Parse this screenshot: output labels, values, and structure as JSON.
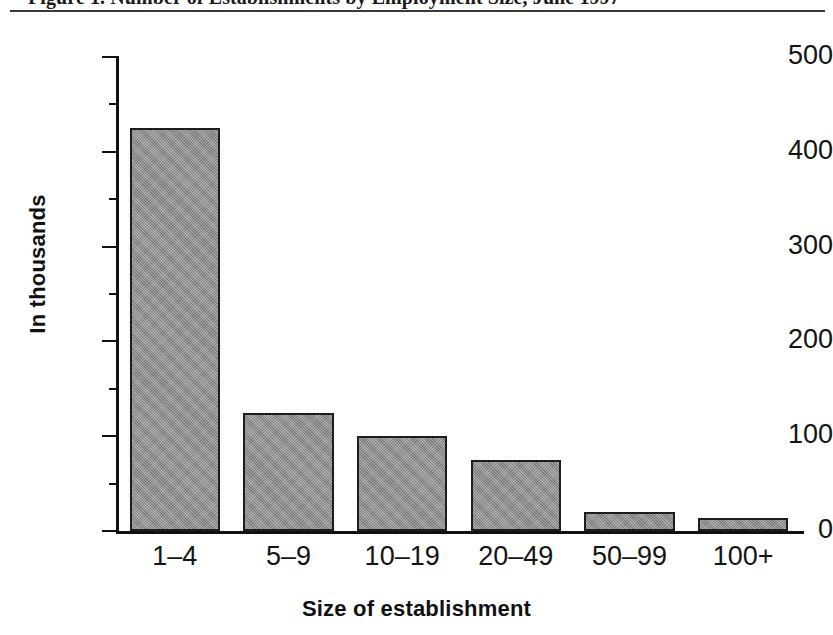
{
  "figure": {
    "title": "Figure 1.  Number of Establishments by Employment Size, June 1997",
    "rule_color": "#3a3a3a"
  },
  "chart_data": {
    "type": "bar",
    "title": "Figure 1.  Number of Establishments by Employment Size, June 1997",
    "categories": [
      "1–4",
      "5–9",
      "10–19",
      "20–49",
      "50–99",
      "100+"
    ],
    "values": [
      425,
      125,
      100,
      75,
      20,
      14
    ],
    "xlabel": "Size of establishment",
    "ylabel": "In thousands",
    "ylim": [
      0,
      500
    ],
    "ytick_labels": [
      "0",
      "100",
      "200",
      "300",
      "400",
      "500"
    ],
    "ytick_values": [
      0,
      100,
      200,
      300,
      400,
      500
    ],
    "yminor_values": [
      50,
      150,
      250,
      350,
      450
    ],
    "grid": false,
    "legend": null,
    "series_name": "Number of establishments",
    "bar_color": "#8c8c8c",
    "bar_edge_color": "#1d1d1d",
    "units": "thousands"
  }
}
